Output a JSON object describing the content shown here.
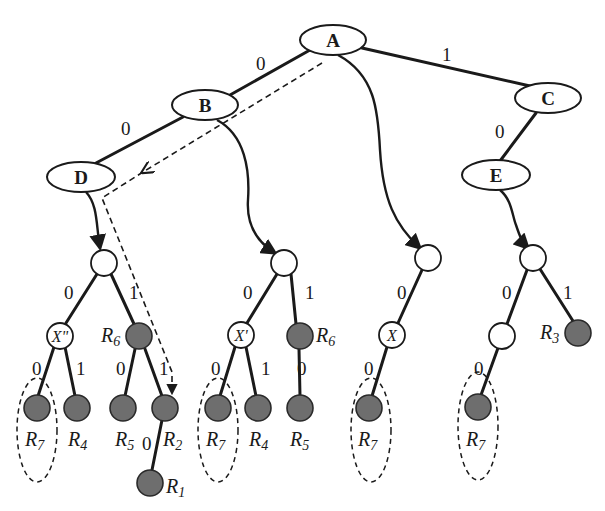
{
  "diagram": {
    "type": "binary trie with subtrees",
    "named_nodes": [
      {
        "id": "A",
        "label": "A"
      },
      {
        "id": "B",
        "label": "B"
      },
      {
        "id": "C",
        "label": "C"
      },
      {
        "id": "D",
        "label": "D"
      },
      {
        "id": "E",
        "label": "E"
      }
    ],
    "top_edges": [
      {
        "from": "A",
        "to": "B",
        "label": "0"
      },
      {
        "from": "A",
        "to": "C",
        "label": "1"
      },
      {
        "from": "B",
        "to": "D",
        "label": "0"
      },
      {
        "from": "C",
        "to": "E",
        "label": "0"
      }
    ],
    "subtrees": [
      {
        "attached_to": "D",
        "inner_label": "X\"",
        "edges": {
          "root_left": "0",
          "root_right": "1",
          "x_left": "0",
          "x_right": "1",
          "r6_left": "0",
          "r6_right": "1",
          "r2_down": "0"
        },
        "rules": {
          "r6": {
            "base": "R",
            "sub": "6"
          },
          "leaf1": {
            "base": "R",
            "sub": "7"
          },
          "leaf2": {
            "base": "R",
            "sub": "4"
          },
          "leaf3": {
            "base": "R",
            "sub": "5"
          },
          "leaf4": {
            "base": "R",
            "sub": "2"
          },
          "leaf5": {
            "base": "R",
            "sub": "1"
          }
        }
      },
      {
        "attached_to": "B",
        "inner_label": "X'",
        "edges": {
          "root_left": "0",
          "root_right": "1",
          "x_left": "0",
          "x_right": "1",
          "r6_left": "0"
        },
        "rules": {
          "r6": {
            "base": "R",
            "sub": "6"
          },
          "leaf1": {
            "base": "R",
            "sub": "7"
          },
          "leaf2": {
            "base": "R",
            "sub": "4"
          },
          "leaf3": {
            "base": "R",
            "sub": "5"
          }
        }
      },
      {
        "attached_to": "A",
        "inner_label": "X",
        "edges": {
          "root_left": "0",
          "x_left": "0"
        },
        "rules": {
          "leaf1": {
            "base": "R",
            "sub": "7"
          }
        }
      },
      {
        "attached_to": "E",
        "edges": {
          "root_left": "0",
          "root_right": "1",
          "mid_left": "0"
        },
        "rules": {
          "r3": {
            "base": "R",
            "sub": "3"
          },
          "leaf1": {
            "base": "R",
            "sub": "7"
          }
        }
      }
    ],
    "colors": {
      "line": "#1a1a1a",
      "filled_node": "#6e6e6e",
      "background": "#ffffff"
    }
  }
}
